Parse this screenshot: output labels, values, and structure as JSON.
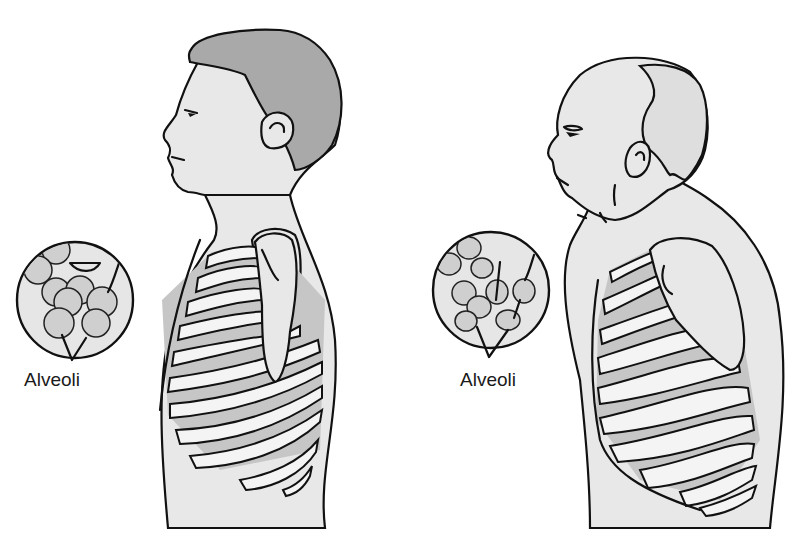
{
  "figure": {
    "panels": [
      {
        "id": "young",
        "subject": "young adult profile with dark hair",
        "inset_label": "Alveoli",
        "features": [
          "upright posture",
          "horizontal ribs",
          "round distinct alveoli"
        ]
      },
      {
        "id": "elderly",
        "subject": "elderly adult profile, balding, stooped",
        "inset_label": "Alveoli",
        "features": [
          "kyphotic posture",
          "barrel chest",
          "slanted ribs",
          "enlarged irregular alveoli"
        ]
      }
    ],
    "colors": {
      "skin": "#e8e8e8",
      "hair_young": "#a9a9a9",
      "intercostal": "#c6c6c6",
      "outline": "#111111",
      "background": "#ffffff"
    }
  }
}
